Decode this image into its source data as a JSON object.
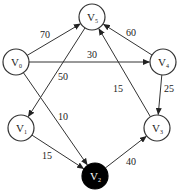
{
  "graph": {
    "type": "directed-weighted",
    "nodes": [
      {
        "id": "V0",
        "label": "V",
        "sub": "0",
        "x": 16,
        "y": 62,
        "filled": false
      },
      {
        "id": "V1",
        "label": "V",
        "sub": "1",
        "x": 21,
        "y": 128,
        "filled": false
      },
      {
        "id": "V2",
        "label": "V",
        "sub": "2",
        "x": 95,
        "y": 176,
        "filled": true
      },
      {
        "id": "V3",
        "label": "V",
        "sub": "3",
        "x": 157,
        "y": 128,
        "filled": false
      },
      {
        "id": "V4",
        "label": "V",
        "sub": "4",
        "x": 163,
        "y": 62,
        "filled": false
      },
      {
        "id": "V5",
        "label": "V",
        "sub": "5",
        "x": 92,
        "y": 17,
        "filled": false
      }
    ],
    "edges": [
      {
        "from": "V0",
        "to": "V5",
        "weight": "70",
        "lx": 40,
        "ly": 38
      },
      {
        "from": "V0",
        "to": "V4",
        "weight": "30",
        "lx": 87,
        "ly": 58
      },
      {
        "from": "V4",
        "to": "V5",
        "weight": "60",
        "lx": 126,
        "ly": 36
      },
      {
        "from": "V5",
        "to": "V1",
        "weight": "50",
        "lx": 58,
        "ly": 80
      },
      {
        "from": "V0",
        "to": "V2",
        "weight": "10",
        "lx": 58,
        "ly": 120
      },
      {
        "from": "V1",
        "to": "V2",
        "weight": "15",
        "lx": 42,
        "ly": 159
      },
      {
        "from": "V2",
        "to": "V3",
        "weight": "40",
        "lx": 126,
        "ly": 165
      },
      {
        "from": "V4",
        "to": "V3",
        "weight": "25",
        "lx": 164,
        "ly": 92
      },
      {
        "from": "V3",
        "to": "V5",
        "weight": "15",
        "lx": 113,
        "ly": 92
      }
    ],
    "colors": {
      "stroke": "#333333",
      "filled_node": "#000000",
      "background": "#ffffff"
    }
  }
}
